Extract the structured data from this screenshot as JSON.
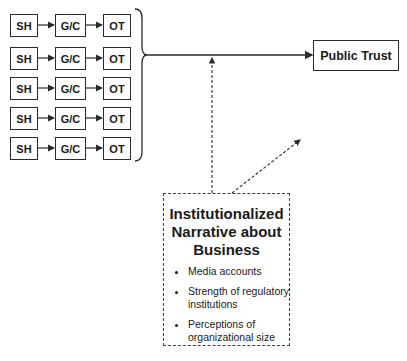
{
  "diagram": {
    "rows": [
      {
        "source": "SH",
        "mediator": "G/C",
        "outcome": "OT"
      },
      {
        "source": "SH",
        "mediator": "G/C",
        "outcome": "OT"
      },
      {
        "source": "SH",
        "mediator": "G/C",
        "outcome": "OT"
      },
      {
        "source": "SH",
        "mediator": "G/C",
        "outcome": "OT"
      },
      {
        "source": "SH",
        "mediator": "G/C",
        "outcome": "OT"
      }
    ],
    "target": "Public Trust",
    "narrative": {
      "title_lines": [
        "Institutionalized",
        "Narrative about",
        "Business"
      ],
      "bullets": [
        "Media accounts",
        "Strength of regulatory institutions",
        "Perceptions of organizational size"
      ]
    },
    "colors": {
      "line": "#2a2a2a",
      "background": "#ffffff"
    }
  }
}
